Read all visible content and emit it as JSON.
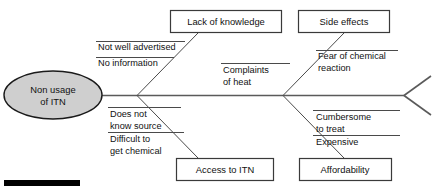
{
  "diagram": {
    "type": "fishbone",
    "title": "",
    "effect": {
      "label_line_1": "Non usage",
      "label_line_2": "of ITN",
      "shape": "ellipse",
      "fill_color": "#cfcfcf",
      "stroke_color": "#1a1a1a"
    },
    "line_color": "#4a4a4a",
    "box_fill": "#ffffff",
    "box_stroke": "#3a3a3a",
    "categories": [
      {
        "id": "lack-of-knowledge",
        "label": "Lack of knowledge",
        "position": "top-left",
        "causes": [
          {
            "text": "Not well advertised"
          },
          {
            "text": "No information"
          }
        ]
      },
      {
        "id": "side-effects",
        "label": "Side effects",
        "position": "top-right",
        "causes": [
          {
            "text": "Fear of chemical"
          },
          {
            "text": "reaction"
          }
        ]
      },
      {
        "id": "access-to-itn",
        "label": "Access to ITN",
        "position": "bottom-left",
        "causes": [
          {
            "text": "Does not"
          },
          {
            "text": "know source"
          },
          {
            "text": "Difficult to"
          },
          {
            "text": "get chemical"
          }
        ]
      },
      {
        "id": "affordability",
        "label": "Affordability",
        "position": "bottom-right",
        "causes": [
          {
            "text": "Cumbersome"
          },
          {
            "text": "to treat"
          },
          {
            "text": "Expensive"
          }
        ]
      }
    ],
    "spine_causes": [
      {
        "id": "complaints-of-heat",
        "text_line_1": "Complaints",
        "text_line_2": "of heat"
      }
    ],
    "labels": {
      "not_well_advertised": "Not well advertised",
      "no_information": "No information",
      "fear_of_chemical": "Fear of chemical",
      "reaction": "reaction",
      "complaints": "Complaints",
      "of_heat": "of heat",
      "does_not": "Does not",
      "know_source": "know source",
      "difficult_to": "Difficult to",
      "get_chemical": "get chemical",
      "cumbersome": "Cumbersome",
      "to_treat": "to treat",
      "expensive": "Expensive"
    },
    "footer_marker": {
      "name": "redaction-bar",
      "color": "#000000"
    }
  }
}
